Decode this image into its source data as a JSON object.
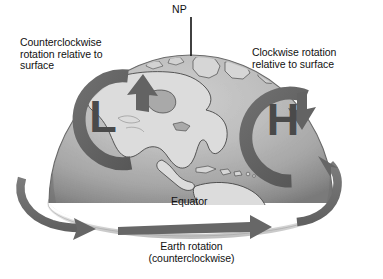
{
  "figure": {
    "background_color": "#ffffff",
    "arrow_color": "#6e6e6e",
    "arrow_color_dark": "#5b5b5b",
    "globe_land_color": "#d9d9d9",
    "globe_ocean_color": "#a8a8a8",
    "text_color": "#111111"
  },
  "labels": {
    "north_pole": "NP",
    "left_caption": "Counterclockwise\nrotation relative to\nsurface",
    "right_caption": "Clockwise rotation\nrelative to surface",
    "equator": "Equator",
    "bottom_caption": "Earth rotation\n(counterclockwise)"
  },
  "symbols": {
    "low_pressure": "L",
    "high_pressure": "H"
  },
  "annotations": {
    "low_rotation_direction": "counterclockwise",
    "high_rotation_direction": "clockwise",
    "earth_rotation_direction": "counterclockwise",
    "hemisphere": "Northern Hemisphere"
  }
}
